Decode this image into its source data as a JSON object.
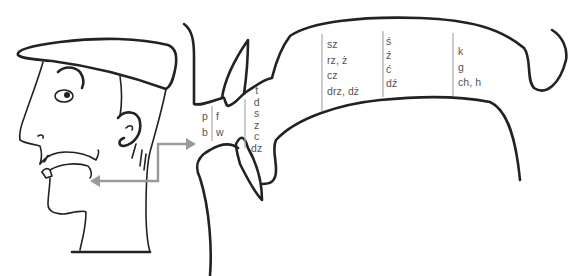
{
  "diagram": {
    "title": "",
    "type": "articulation-places-sagittal-section",
    "colors": {
      "ink": "#222222",
      "label_text": "#555555",
      "divider": "#b0b0b0",
      "arrow": "#9a9a9a",
      "background": "#ffffff"
    },
    "illustrations": [
      {
        "name": "head-profile",
        "description": "cartoon head with flat cap, side view"
      },
      {
        "name": "vocal-tract-cross-section",
        "description": "enlarged mouth cavity cross-section"
      }
    ],
    "connector": {
      "name": "zoom-arrows",
      "description": "gray double arrow linking mouth of head to enlarged cross-section"
    },
    "groups": [
      {
        "id": "bilabial",
        "labels": [
          "p",
          "b"
        ]
      },
      {
        "id": "labiodental",
        "labels": [
          "f",
          "w"
        ]
      },
      {
        "id": "dental",
        "labels": [
          "t",
          "d",
          "s",
          "z",
          "c",
          "dz"
        ]
      },
      {
        "id": "postalveolar",
        "labels": [
          "sz",
          "rz, ż",
          "cz",
          "drz, dż"
        ]
      },
      {
        "id": "alveolopalatal",
        "labels": [
          "ś",
          "ź",
          "ć",
          "dź"
        ]
      },
      {
        "id": "velar",
        "labels": [
          "k",
          "g",
          "ch, h"
        ]
      }
    ]
  }
}
